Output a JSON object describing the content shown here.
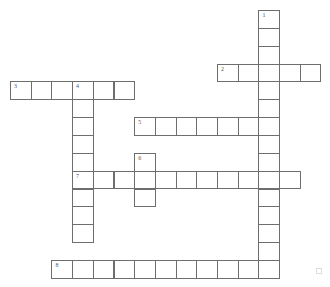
{
  "puzzle": {
    "type": "crossword",
    "grid": {
      "origin_x": 10,
      "origin_y": 10,
      "col_pitch": 20.7,
      "row_pitch": 17.85
    },
    "colors": {
      "border": "#6e6e6e",
      "cell_bg": "#ffffff",
      "number": "#555555"
    },
    "entries": [
      {
        "number": "1",
        "direction": "down",
        "row": 0,
        "col": 12,
        "length": 15
      },
      {
        "number": "2",
        "direction": "across",
        "row": 3,
        "col": 10,
        "length": 5
      },
      {
        "number": "3",
        "direction": "across",
        "row": 4,
        "col": 0,
        "length": 6
      },
      {
        "number": "4",
        "direction": "down",
        "row": 4,
        "col": 3,
        "length": 9
      },
      {
        "number": "5",
        "direction": "across",
        "row": 6,
        "col": 6,
        "length": 7
      },
      {
        "number": "6",
        "direction": "down",
        "row": 8,
        "col": 6,
        "length": 3
      },
      {
        "number": "7",
        "direction": "across",
        "row": 9,
        "col": 3,
        "length": 11
      },
      {
        "number": "8",
        "direction": "across",
        "row": 14,
        "col": 2,
        "length": 11
      }
    ]
  }
}
